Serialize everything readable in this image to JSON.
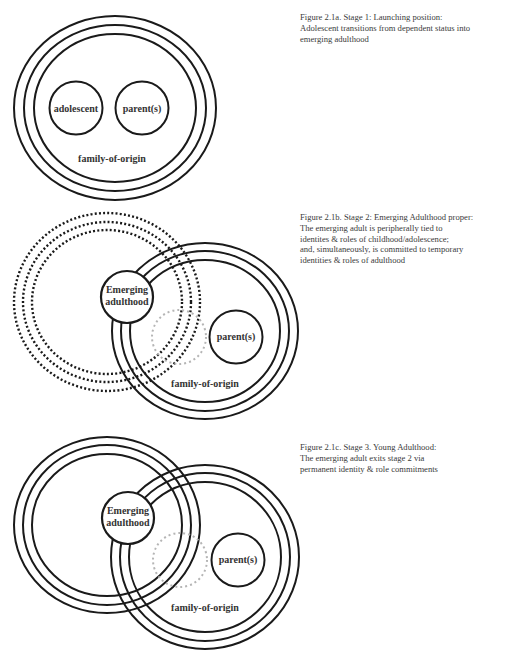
{
  "figures": [
    {
      "id": "2.1a",
      "caption_lines": [
        "Figure 2.1a. Stage 1: Launching position:",
        "Adolescent transitions from dependent status into",
        "emerging adulthood"
      ],
      "labels": {
        "left_circle": "adolescent",
        "right_circle": "parent(s)",
        "ring": "family-of-origin"
      }
    },
    {
      "id": "2.1b",
      "caption_lines": [
        "Figure 2.1b. Stage 2: Emerging Adulthood proper:",
        "The emerging adult is peripherally tied to",
        "identites & roles of childhood/adolescence;",
        "and, simultaneously, is committed to temporary",
        "identities & roles of adulthood"
      ],
      "labels": {
        "emerging_line1": "Emerging",
        "emerging_line2": "adulthood",
        "right_circle": "parent(s)",
        "ring": "family-of-origin"
      }
    },
    {
      "id": "2.1c",
      "caption_lines": [
        "Figure 2.1c. Stage 3. Young Adulthood:",
        "The emerging adult exits stage 2 via",
        "permanent identity & role commitments"
      ],
      "labels": {
        "emerging_line1": "Emerging",
        "emerging_line2": "adulthood",
        "right_circle": "parent(s)",
        "ring": "family-of-origin"
      }
    }
  ],
  "colors": {
    "stroke": "#1a1a1a",
    "dotted_grey": "#b5b5b5",
    "text": "#333333"
  }
}
